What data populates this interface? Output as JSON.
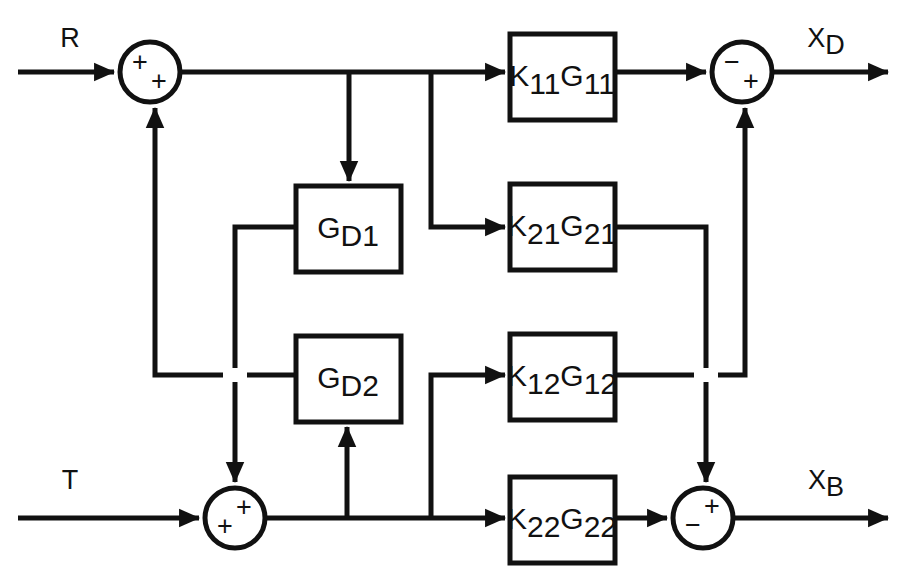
{
  "diagram": {
    "background_color": "#ffffff",
    "line_color": "#111111",
    "inputs": [
      {
        "name": "input-r",
        "label": "R",
        "sub": "",
        "x": 70,
        "y": 40
      },
      {
        "name": "input-t",
        "label": "T",
        "sub": "",
        "x": 70,
        "y": 480
      }
    ],
    "outputs": [
      {
        "name": "output-xd",
        "label": "X",
        "sub": "D",
        "x": 830,
        "y": 40
      },
      {
        "name": "output-xb",
        "label": "X",
        "sub": "B",
        "x": 830,
        "y": 480
      }
    ],
    "blocks": [
      {
        "id": "k11g11",
        "label": "K",
        "sub1": "11",
        "label2": "G",
        "sub2": "11",
        "x": 510,
        "y": 34,
        "w": 105,
        "h": 86
      },
      {
        "id": "k21g21",
        "label": "K",
        "sub1": "21",
        "label2": "G",
        "sub2": "21",
        "x": 510,
        "y": 184,
        "w": 105,
        "h": 86
      },
      {
        "id": "k12g12",
        "label": "K",
        "sub1": "12",
        "label2": "G",
        "sub2": "12",
        "x": 510,
        "y": 334,
        "w": 105,
        "h": 86
      },
      {
        "id": "k22g22",
        "label": "K",
        "sub1": "22",
        "label2": "G",
        "sub2": "22",
        "x": 510,
        "y": 477,
        "w": 105,
        "h": 86
      },
      {
        "id": "gd1",
        "label": "G",
        "sub1": "D1",
        "label2": "",
        "sub2": "",
        "x": 296,
        "y": 186,
        "w": 105,
        "h": 86
      },
      {
        "id": "gd2",
        "label": "G",
        "sub1": "D2",
        "label2": "",
        "sub2": "",
        "x": 296,
        "y": 336,
        "w": 105,
        "h": 86
      }
    ],
    "junctions": [
      {
        "id": "sum-r",
        "name": "summing-junction-r",
        "cx": 150,
        "cy": 72,
        "r": 30,
        "signs": [
          {
            "text": "+",
            "dx": -10,
            "dy": -8
          },
          {
            "text": "+",
            "dx": 9,
            "dy": 11
          }
        ]
      },
      {
        "id": "sum-xd",
        "name": "summing-junction-xd",
        "cx": 742,
        "cy": 72,
        "r": 30,
        "signs": [
          {
            "text": "−",
            "dx": -10,
            "dy": -8
          },
          {
            "text": "+",
            "dx": 9,
            "dy": 11
          }
        ]
      },
      {
        "id": "sum-t",
        "name": "summing-junction-t",
        "cx": 235,
        "cy": 518,
        "r": 30,
        "signs": [
          {
            "text": "+",
            "dx": 9,
            "dy": -9
          },
          {
            "text": "+",
            "dx": -10,
            "dy": 10
          }
        ]
      },
      {
        "id": "sum-xb",
        "name": "summing-junction-xb",
        "cx": 703,
        "cy": 518,
        "r": 30,
        "signs": [
          {
            "text": "+",
            "dx": 9,
            "dy": -10
          },
          {
            "text": "−",
            "dx": -10,
            "dy": 9
          }
        ]
      }
    ],
    "signal_paths": [
      {
        "name": "r-to-sum",
        "description": "R input into top-left summing junction"
      },
      {
        "name": "sum-to-k11g11",
        "description": "top forward path to K11G11"
      },
      {
        "name": "branch-to-gd1",
        "description": "branch from top line down into GD1"
      },
      {
        "name": "branch-to-k21g21",
        "description": "branch from top line down into K21G21"
      },
      {
        "name": "k11g11-to-sum-xd",
        "description": "K11G11 output to XD summing junction"
      },
      {
        "name": "k21g21-feedback-down",
        "description": "K21G21 output routed down to XB junction"
      },
      {
        "name": "k12g12-feedback-up",
        "description": "K12G12 output routed up to XD junction"
      },
      {
        "name": "gd1-output-left",
        "description": "GD1 output routed left and down"
      },
      {
        "name": "gd2-output-left",
        "description": "GD2 output routed left and up to R junction"
      },
      {
        "name": "t-to-sum",
        "description": "T input into bottom-left summing junction"
      },
      {
        "name": "sum-to-k22g22",
        "description": "bottom forward path to K22G22"
      },
      {
        "name": "branch-to-gd2",
        "description": "branch from bottom line up into GD2"
      },
      {
        "name": "branch-to-k12g12",
        "description": "branch from bottom line up into K12G12"
      },
      {
        "name": "k22g22-to-sum-xb",
        "description": "K22G22 output to XB summing junction"
      }
    ]
  }
}
